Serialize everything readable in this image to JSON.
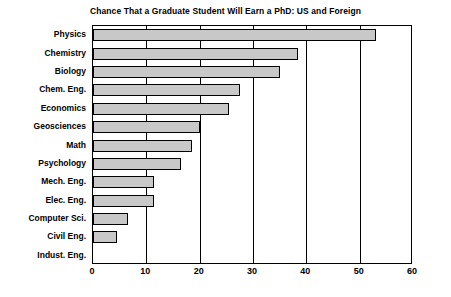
{
  "chart_data": {
    "type": "bar",
    "orientation": "horizontal",
    "title": "Chance That a Graduate Student Will Earn a PhD: US and Foreign",
    "xlabel": "",
    "ylabel": "",
    "xlim": [
      0,
      60
    ],
    "xticks": [
      0,
      10,
      20,
      30,
      40,
      50,
      60
    ],
    "grid": true,
    "legend": "none",
    "bar_color": "#c8c8c8",
    "bar_edge_color": "#000000",
    "categories": [
      "Physics",
      "Chemistry",
      "Biology",
      "Chem. Eng.",
      "Economics",
      "Geosciences",
      "Math",
      "Psychology",
      "Mech. Eng.",
      "Elec. Eng.",
      "Computer Sci.",
      "Civil Eng.",
      "Indust. Eng."
    ],
    "values": [
      53,
      38.5,
      35,
      27.5,
      25.5,
      20,
      18.5,
      16.5,
      11.5,
      11.5,
      6.5,
      4.5,
      0
    ]
  }
}
